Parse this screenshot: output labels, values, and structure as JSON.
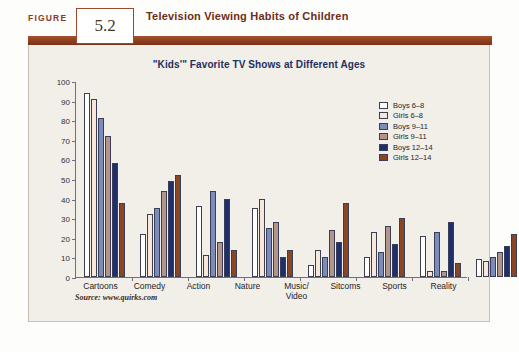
{
  "figure": {
    "label": "FIGURE",
    "number": "5.2",
    "title": "Television Viewing Habits of Children",
    "source": "Source: www.quirks.com"
  },
  "chart_data": {
    "type": "bar",
    "title": "\"Kids'\" Favorite TV Shows at Different Ages",
    "xlabel": "",
    "ylabel": "",
    "ylim": [
      0,
      100
    ],
    "yticks": [
      0,
      10,
      20,
      30,
      40,
      50,
      60,
      70,
      80,
      90,
      100
    ],
    "grid": false,
    "legend_position": "top-right",
    "categories": [
      "Cartoons",
      "Comedy",
      "Action",
      "Nature",
      "Music/ Video",
      "Sitcoms",
      "Sports",
      "Reality"
    ],
    "series": [
      {
        "name": "Boys 6–8",
        "color": "#ffffff",
        "values": [
          94,
          22,
          36,
          35,
          6,
          10,
          21,
          9
        ]
      },
      {
        "name": "Girls 6–8",
        "color": "#f6e7d8",
        "values": [
          91,
          32,
          11,
          40,
          14,
          23,
          3,
          8
        ]
      },
      {
        "name": "Boys 9–11",
        "color": "#7b8cba",
        "values": [
          81,
          35,
          44,
          25,
          10,
          13,
          23,
          10
        ]
      },
      {
        "name": "Girls 9–11",
        "color": "#b2948a",
        "values": [
          72,
          44,
          18,
          28,
          24,
          26,
          3,
          13
        ]
      },
      {
        "name": "Boys 12–14",
        "color": "#1f2f6e",
        "values": [
          58,
          49,
          40,
          10,
          18,
          17,
          28,
          16
        ]
      },
      {
        "name": "Girls 12–14",
        "color": "#8a4620",
        "values": [
          38,
          52,
          14,
          14,
          38,
          30,
          7,
          22
        ]
      }
    ]
  },
  "colors": {
    "accent_brown": "#8e3e20",
    "title_navy": "#23305e",
    "panel_background": "#f2efe9"
  }
}
